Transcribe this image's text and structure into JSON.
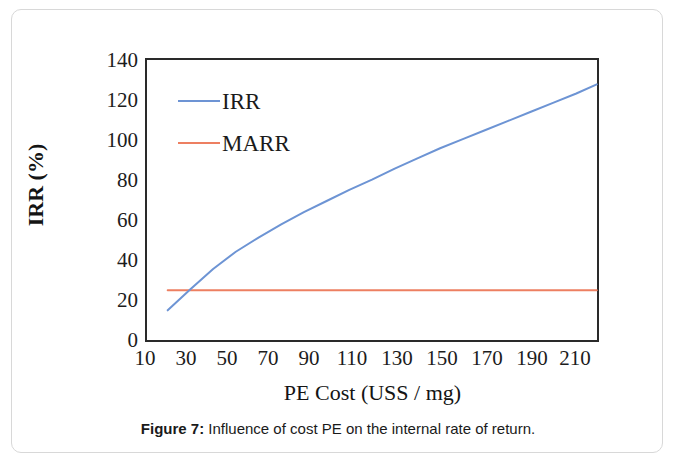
{
  "figure": {
    "caption_label": "Figure 7:",
    "caption_text": " Influence of cost PE on the internal rate of return."
  },
  "chart_data": {
    "type": "line",
    "title": "",
    "xlabel": "PE Cost (USS / mg)",
    "ylabel": "IRR (%)",
    "xlim": [
      10,
      210
    ],
    "ylim": [
      0,
      140
    ],
    "xticks": [
      10,
      30,
      50,
      70,
      90,
      110,
      130,
      150,
      170,
      190,
      210
    ],
    "yticks": [
      0,
      20,
      40,
      60,
      80,
      100,
      120,
      140
    ],
    "grid": false,
    "legend_position": "upper-left-inside",
    "series": [
      {
        "name": "IRR",
        "color": "#6d94d4",
        "x": [
          20,
          30,
          40,
          50,
          60,
          70,
          80,
          90,
          100,
          110,
          120,
          130,
          140,
          150,
          160,
          170,
          180,
          190,
          200,
          209
        ],
        "values": [
          15.6,
          26.0,
          36.0,
          44.5,
          51.5,
          58.0,
          64.0,
          69.5,
          75.0,
          80.0,
          85.5,
          90.5,
          95.5,
          100.0,
          104.5,
          109.0,
          113.5,
          118.0,
          122.5,
          127.0
        ]
      },
      {
        "name": "MARR",
        "color": "#ed7f61",
        "x": [
          20,
          209
        ],
        "values": [
          25.5,
          25.5
        ]
      }
    ]
  }
}
